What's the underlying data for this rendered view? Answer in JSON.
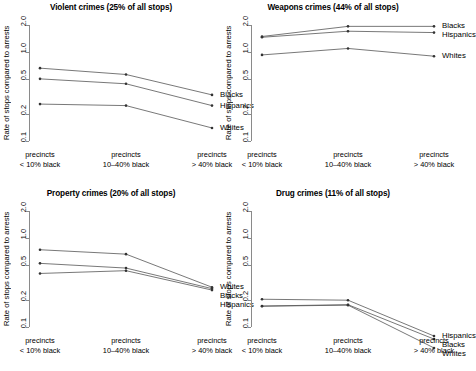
{
  "figure": {
    "ylabel": "Rate of stops compared to arrests",
    "y_ticks": [
      "0.1",
      "0.2",
      "0.5",
      "1.0",
      "2.0"
    ],
    "y_tick_values": [
      0.1,
      0.2,
      0.5,
      1.0,
      2.0
    ],
    "ylim": [
      0.09,
      2.3
    ],
    "x_categories": [
      {
        "line1": "precincts",
        "line2": "< 10% black"
      },
      {
        "line1": "precincts",
        "line2": "10–40% black"
      },
      {
        "line1": "precincts",
        "line2": "> 40% black"
      }
    ],
    "line_color": "#555555",
    "axis_color": "#8a8a8a"
  },
  "chart_data": [
    {
      "type": "line",
      "panel": "top-left",
      "title": "Violent crimes (25% of all stops)",
      "xlabel": "",
      "ylabel": "Rate of stops compared to arrests",
      "log_y": true,
      "ylim": [
        0.09,
        2.3
      ],
      "categories": [
        "precincts < 10% black",
        "precincts 10–40% black",
        "precincts > 40% black"
      ],
      "series": [
        {
          "name": "Blacks",
          "values": [
            0.66,
            0.56,
            0.33
          ]
        },
        {
          "name": "Hispanics",
          "values": [
            0.5,
            0.44,
            0.25
          ]
        },
        {
          "name": "Whites",
          "values": [
            0.26,
            0.25,
            0.14
          ]
        }
      ],
      "series_label_order": [
        "Blacks",
        "Hispanics",
        "Whites"
      ]
    },
    {
      "type": "line",
      "panel": "top-right",
      "title": "Weapons crimes (44% of all stops)",
      "xlabel": "",
      "ylabel": "Rate of stops compared to arrests",
      "log_y": true,
      "ylim": [
        0.09,
        2.3
      ],
      "categories": [
        "precincts < 10% black",
        "precincts 10–40% black",
        "precincts > 40% black"
      ],
      "series": [
        {
          "name": "Blacks",
          "values": [
            1.5,
            1.95,
            1.95
          ]
        },
        {
          "name": "Hispanics",
          "values": [
            1.47,
            1.72,
            1.66
          ]
        },
        {
          "name": "Whites",
          "values": [
            0.93,
            1.1,
            0.9
          ]
        }
      ],
      "series_label_order": [
        "Blacks",
        "Hispanics",
        "Whites"
      ]
    },
    {
      "type": "line",
      "panel": "bottom-left",
      "title": "Property crimes (20% of all stops)",
      "xlabel": "",
      "ylabel": "Rate of stops compared to arrests",
      "log_y": true,
      "ylim": [
        0.09,
        2.3
      ],
      "categories": [
        "precincts < 10% black",
        "precincts 10–40% black",
        "precincts > 40% black"
      ],
      "series": [
        {
          "name": "Whites",
          "values": [
            0.74,
            0.66,
            0.28
          ]
        },
        {
          "name": "Blacks",
          "values": [
            0.52,
            0.46,
            0.27
          ]
        },
        {
          "name": "Hispanics",
          "values": [
            0.4,
            0.43,
            0.26
          ]
        }
      ],
      "series_label_order": [
        "Whites",
        "Blacks",
        "Hispanics"
      ]
    },
    {
      "type": "line",
      "panel": "bottom-right",
      "title": "Drug crimes (11% of all stops)",
      "xlabel": "",
      "ylabel": "Rate of stops compared to arrests",
      "log_y": true,
      "ylim": [
        0.09,
        2.3
      ],
      "categories": [
        "precincts < 10% black",
        "precincts 10–40% black",
        "precincts > 40% black"
      ],
      "series": [
        {
          "name": "Hispanics",
          "values": [
            0.205,
            0.2,
            0.079
          ]
        },
        {
          "name": "Blacks",
          "values": [
            0.172,
            0.178,
            0.073
          ]
        },
        {
          "name": "Whites",
          "values": [
            0.171,
            0.176,
            0.058
          ]
        }
      ],
      "series_label_order": [
        "Hispanics",
        "Blacks",
        "Whites"
      ]
    }
  ]
}
